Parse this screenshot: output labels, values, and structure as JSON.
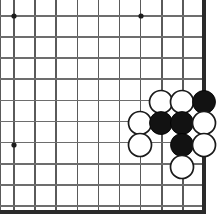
{
  "board": {
    "title": "Go board corner diagram",
    "type": "go-board",
    "width_px": 218,
    "height_px": 219,
    "grid": {
      "origin_x": 14,
      "origin_y": 16,
      "spacing": 21.1,
      "cols": 10,
      "rows": 10,
      "line_color": "#5a5a5a",
      "edge_color": "#2a2a2a",
      "background_color": "#ffffff"
    },
    "edges": {
      "right_border_x": 204,
      "bottom_border_y": 212,
      "right_visible": true,
      "bottom_visible": true,
      "top_visible": false,
      "left_visible": false
    },
    "star_points": [
      {
        "x": 14,
        "y": 16
      },
      {
        "x": 141,
        "y": 16
      },
      {
        "x": 14,
        "y": 145
      }
    ],
    "stone_radius": 11.5,
    "stone_colors": {
      "black": "#121212",
      "white": "#ffffff",
      "white_outline": "#1a1a1a"
    },
    "stones": [
      {
        "color": "white",
        "x": 161,
        "y": 102,
        "label": "white-stone-1"
      },
      {
        "color": "white",
        "x": 182,
        "y": 102,
        "label": "white-stone-2"
      },
      {
        "color": "black",
        "x": 204,
        "y": 102,
        "label": "black-stone-1"
      },
      {
        "color": "white",
        "x": 140,
        "y": 123,
        "label": "white-stone-3"
      },
      {
        "color": "black",
        "x": 161,
        "y": 123,
        "label": "black-stone-2"
      },
      {
        "color": "black",
        "x": 182,
        "y": 123,
        "label": "black-stone-3"
      },
      {
        "color": "white",
        "x": 204,
        "y": 123,
        "label": "white-stone-4"
      },
      {
        "color": "white",
        "x": 140,
        "y": 145,
        "label": "white-stone-5"
      },
      {
        "color": "black",
        "x": 182,
        "y": 145,
        "label": "black-stone-4"
      },
      {
        "color": "white",
        "x": 204,
        "y": 145,
        "label": "white-stone-6"
      },
      {
        "color": "white",
        "x": 182,
        "y": 167,
        "label": "white-stone-7"
      }
    ]
  }
}
